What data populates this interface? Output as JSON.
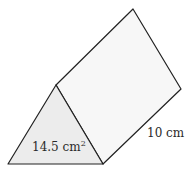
{
  "diagram": {
    "shape": "triangular prism",
    "face_area_label": "14.5 cm",
    "face_area_exponent": "2",
    "length_label": "10 cm",
    "colors": {
      "stroke": "#222222",
      "front_face_fill": "#ececec",
      "side_face_fill": "#f7f7f7"
    }
  }
}
